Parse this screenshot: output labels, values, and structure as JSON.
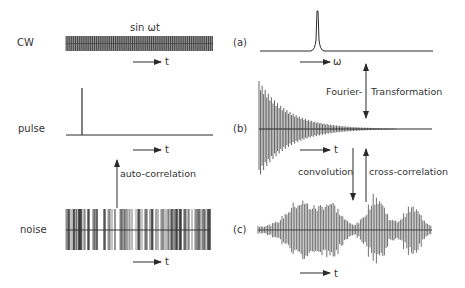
{
  "left_column": {
    "cw": {
      "row_label": "CW",
      "signal_label": "sin ωt",
      "axis_label": "t"
    },
    "pulse": {
      "row_label": "pulse",
      "axis_label": "t"
    },
    "noise": {
      "row_label": "noise",
      "axis_label": "t"
    },
    "arrow_autocorrelation": "auto-correlation"
  },
  "right_column": {
    "a": {
      "panel_label": "(a)",
      "axis_label": "ω"
    },
    "b": {
      "panel_label": "(b)",
      "axis_label": "t"
    },
    "c": {
      "panel_label": "(c)",
      "axis_label": "t"
    },
    "arrow_fourier_left": "Fourier-",
    "arrow_fourier_right": "Transformation",
    "arrow_convolution": "convolution",
    "arrow_crosscorrelation": "cross-correlation"
  },
  "colors": {
    "ink": "#2a2a2a",
    "background": "#ffffff"
  }
}
